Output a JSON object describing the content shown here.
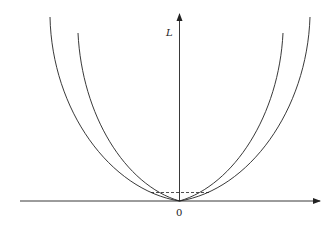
{
  "diagram": {
    "y_axis_label": "L",
    "origin_label": "0",
    "colors": {
      "stroke": "#222222",
      "background": "#ffffff"
    },
    "curves": [
      {
        "name": "outer-curve",
        "description": "wider U-shaped curve"
      },
      {
        "name": "inner-curve",
        "description": "narrower U-shaped curve"
      }
    ],
    "dashed_line": {
      "description": "horizontal dashed line near the origin between the two curves' intersections"
    }
  }
}
